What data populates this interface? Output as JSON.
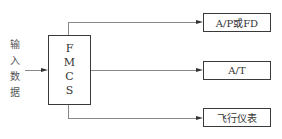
{
  "diagram": {
    "input": {
      "label_chars": [
        "输",
        "入",
        "数",
        "据"
      ]
    },
    "center": {
      "label_chars": [
        "F",
        "M",
        "C",
        "S"
      ]
    },
    "outputs": [
      {
        "label": "A/P或FD"
      },
      {
        "label": "A/T"
      },
      {
        "label": "飞行仪表"
      }
    ],
    "colors": {
      "line": "#888888",
      "border": "#3a3a3a",
      "text": "#333333"
    }
  }
}
